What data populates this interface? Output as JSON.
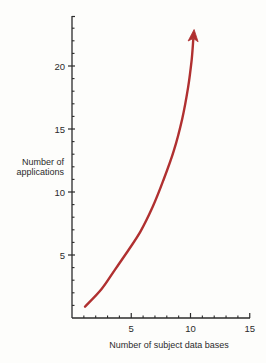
{
  "chart_data": {
    "type": "line",
    "title": "",
    "xlabel": "Number of subject data bases",
    "ylabel_lines": [
      "Number of",
      "applications"
    ],
    "xlim": [
      0,
      15
    ],
    "ylim": [
      0,
      24
    ],
    "x_ticks_major": [
      5,
      10,
      15
    ],
    "x_ticks_minor": [
      1,
      2,
      3,
      4,
      6,
      7,
      8,
      9,
      11,
      12,
      13,
      14
    ],
    "y_ticks_major": [
      5,
      10,
      20,
      15
    ],
    "y_ticks_minor": [
      1,
      2,
      3,
      4,
      6,
      7,
      8,
      9,
      11,
      12,
      13,
      14,
      16,
      17,
      18,
      19,
      21,
      22,
      23
    ],
    "grid": false,
    "legend": null,
    "series": [
      {
        "name": "Applications vs subject data bases",
        "color": "#b03030",
        "arrow_end": true,
        "x": [
          1.1,
          2.5,
          3.6,
          4.7,
          5.8,
          6.8,
          7.7,
          8.6,
          9.3,
          9.8,
          10.1,
          10.3
        ],
        "y": [
          0.9,
          2.3,
          3.8,
          5.3,
          6.9,
          8.8,
          10.9,
          13.3,
          15.8,
          18.3,
          20.5,
          22.9
        ]
      }
    ]
  },
  "axes": {
    "x_title": "Number of subject data bases",
    "y_title_line1": "Number of",
    "y_title_line2": "applications",
    "x_tick_labels": [
      "5",
      "10",
      "15"
    ],
    "y_tick_labels": [
      "5",
      "10",
      "15",
      "20"
    ]
  },
  "colors": {
    "curve": "#b03030",
    "axis": "#2b2b2b",
    "background": "#fdfdfb"
  }
}
